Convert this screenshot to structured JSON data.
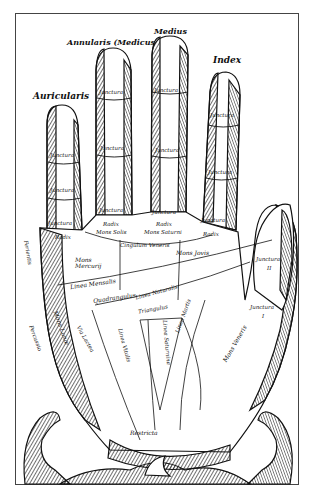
{
  "figure": {
    "fingers": {
      "little": "Auricularis",
      "ring": "Annularis (Medicus",
      "middle": "Medius",
      "index": "Index"
    },
    "joints": {
      "label": "Junctura",
      "numerals": [
        "I",
        "II",
        "III"
      ],
      "root": "Radix",
      "thumb_ii": "II",
      "thumb_i": "I"
    },
    "mounts": {
      "mercury": "Mons Mercurij",
      "apollo": "Mons Solis",
      "saturn": "Mons Saturni",
      "jupiter": "Mons Jovis",
      "venus": "Mons Veneris",
      "moon": "Mons Lunæ"
    },
    "lines": {
      "girdle": "Cingulum Veneris",
      "mensal": "Linea Mensalis",
      "natural": "Linea Naturalis",
      "quadrangle": "Quadrangulus",
      "triangle": "Triangulus",
      "mars": "Linea Martis",
      "saturn": "Linea Saturnina",
      "vital": "Linea Vitalis",
      "hepatic": "Linea Hepatica",
      "via_lactea": "Via Lactea",
      "percussio": "Percussio",
      "ferientis": "Ferientis",
      "restricta": "Restricta"
    }
  }
}
